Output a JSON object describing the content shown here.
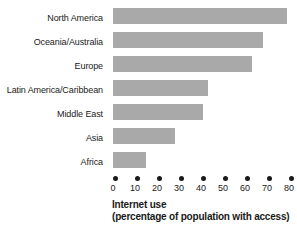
{
  "chart_data": {
    "type": "bar",
    "orientation": "horizontal",
    "title": "",
    "xlabel": "Internet use (percentage of population with access)",
    "xlabel_lines": [
      "Internet use",
      "(percentage of population with access)"
    ],
    "ylabel": "",
    "categories": [
      "North America",
      "Oceania/Australia",
      "Europe",
      "Latin America/Caribbean",
      "Middle East",
      "Asia",
      "Africa"
    ],
    "values": [
      79,
      68,
      63,
      43,
      41,
      28,
      15
    ],
    "xlim": [
      0,
      80
    ],
    "xticks": [
      0,
      10,
      20,
      30,
      40,
      50,
      60,
      70,
      80
    ],
    "xtick_labels": [
      "0",
      "10",
      "20",
      "30",
      "40",
      "50",
      "60",
      "70",
      "80"
    ],
    "grid": false,
    "legend": false,
    "bar_color": "#a9a9a9",
    "text_color": "#1a1a1a",
    "tick_marker_style": "dot"
  }
}
